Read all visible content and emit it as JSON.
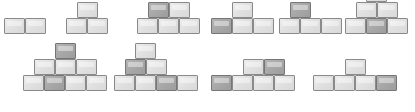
{
  "diagram": {
    "background_color": "#ffffff",
    "brick": {
      "width": 21,
      "height": 16,
      "light_fill": "#e3e3e3",
      "dark_fill": "#a9a9a9",
      "border_color": "#7d7d7d"
    },
    "figures": [
      {
        "name": "figure-1",
        "label": "2 bricks, single row",
        "x": 4,
        "base_y": 34,
        "brick_count": 2,
        "rows": [
          {
            "level": 0,
            "offset": 0,
            "shades": [
              "light",
              "light"
            ]
          }
        ]
      },
      {
        "name": "figure-2",
        "label": "3 bricks, pyramid of 2 over 1",
        "x": 66,
        "base_y": 34,
        "brick_count": 3,
        "rows": [
          {
            "level": 0,
            "offset": 0,
            "shades": [
              "light",
              "light"
            ]
          },
          {
            "level": 1,
            "offset": 10.5,
            "shades": [
              "light"
            ]
          }
        ]
      },
      {
        "name": "figure-3",
        "label": "5 bricks, 3 over 2 with one dark top brick",
        "x": 137,
        "base_y": 34,
        "brick_count": 5,
        "rows": [
          {
            "level": 0,
            "offset": 0,
            "shades": [
              "light",
              "light",
              "light"
            ]
          },
          {
            "level": 1,
            "offset": 10.5,
            "shades": [
              "dark",
              "light"
            ]
          }
        ]
      },
      {
        "name": "figure-4",
        "label": "4 bricks, 3 over 1 with dark leftmost base brick",
        "x": 211,
        "base_y": 34,
        "brick_count": 4,
        "rows": [
          {
            "level": 0,
            "offset": 0,
            "shades": [
              "dark",
              "light",
              "light"
            ]
          },
          {
            "level": 1,
            "offset": 21,
            "shades": [
              "light"
            ]
          }
        ]
      },
      {
        "name": "figure-5",
        "label": "4 bricks, 3 over 1 with dark top brick on the left",
        "x": 279,
        "base_y": 34,
        "brick_count": 4,
        "rows": [
          {
            "level": 0,
            "offset": 0,
            "shades": [
              "light",
              "light",
              "light"
            ]
          },
          {
            "level": 1,
            "offset": 10.5,
            "shades": [
              "dark"
            ]
          }
        ]
      },
      {
        "name": "figure-6",
        "label": "6 bricks, three level pyramid with dark centre base brick",
        "x": 345,
        "base_y": 34,
        "brick_count": 6,
        "rows": [
          {
            "level": 0,
            "offset": 0,
            "shades": [
              "light",
              "dark",
              "light"
            ]
          },
          {
            "level": 1,
            "offset": 10.5,
            "shades": [
              "light",
              "light"
            ]
          },
          {
            "level": 2,
            "offset": 21,
            "shades": [
              "light"
            ]
          }
        ]
      },
      {
        "name": "figure-7",
        "label": "8 bricks, 4 over 3 over 1 with dark second base brick and dark top brick",
        "x": 23,
        "base_y": 91,
        "brick_count": 8,
        "rows": [
          {
            "level": 0,
            "offset": 0,
            "shades": [
              "light",
              "dark",
              "light",
              "light"
            ]
          },
          {
            "level": 1,
            "offset": 10.5,
            "shades": [
              "light",
              "light",
              "light"
            ]
          },
          {
            "level": 2,
            "offset": 31.5,
            "shades": [
              "dark"
            ]
          }
        ]
      },
      {
        "name": "figure-8",
        "label": "7 bricks, 4 over 2 over 1 with dark third base brick and dark middle-left brick",
        "x": 114,
        "base_y": 91,
        "brick_count": 7,
        "rows": [
          {
            "level": 0,
            "offset": 0,
            "shades": [
              "light",
              "light",
              "dark",
              "light"
            ]
          },
          {
            "level": 1,
            "offset": 10.5,
            "shades": [
              "dark",
              "light"
            ]
          },
          {
            "level": 2,
            "offset": 21,
            "shades": [
              "light"
            ]
          }
        ]
      },
      {
        "name": "figure-9",
        "label": "6 bricks, 4 over 2 with dark leftmost base brick and dark top-right brick",
        "x": 211,
        "base_y": 91,
        "brick_count": 6,
        "rows": [
          {
            "level": 0,
            "offset": 0,
            "shades": [
              "dark",
              "light",
              "light",
              "light"
            ]
          },
          {
            "level": 1,
            "offset": 31.5,
            "shades": [
              "light",
              "dark"
            ]
          }
        ]
      },
      {
        "name": "figure-10",
        "label": "5 bricks, 4 over 1 with dark rightmost base brick",
        "x": 313,
        "base_y": 91,
        "brick_count": 5,
        "rows": [
          {
            "level": 0,
            "offset": 0,
            "shades": [
              "light",
              "light",
              "light",
              "dark"
            ]
          },
          {
            "level": 1,
            "offset": 31.5,
            "shades": [
              "light"
            ]
          }
        ]
      }
    ]
  }
}
